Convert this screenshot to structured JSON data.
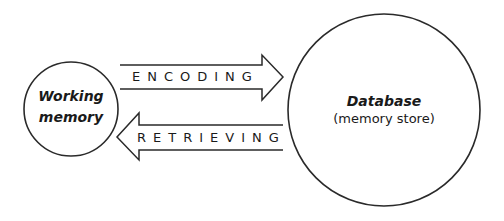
{
  "diagram": {
    "nodes": [
      {
        "id": "working_memory",
        "label_line1": "Working",
        "label_line2": "memory"
      },
      {
        "id": "database",
        "title": "Database",
        "subtitle": "(memory store)"
      }
    ],
    "arrows": [
      {
        "id": "encoding",
        "label": "ENCODING",
        "from": "working_memory",
        "to": "database"
      },
      {
        "id": "retrieving",
        "label": "RETRIEVING",
        "from": "database",
        "to": "working_memory"
      }
    ],
    "colors": {
      "stroke": "#2a2a2a",
      "text": "#1a1a1a",
      "background": "#ffffff"
    }
  }
}
